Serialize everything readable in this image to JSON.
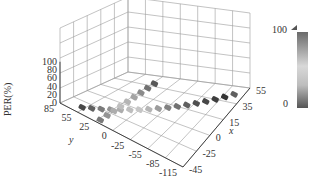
{
  "chart_data": {
    "type": "heatmap",
    "subtype": "3d-scatter-floor-projection",
    "title": "",
    "xlabel": "x",
    "ylabel": "y",
    "zlabel": "PER(%)",
    "x_ticks": [
      "55",
      "35",
      "15",
      "0",
      "-25",
      "-45"
    ],
    "y_ticks": [
      "85",
      "55",
      "25",
      "0",
      "-25",
      "-55",
      "-85",
      "-115"
    ],
    "z_ticks": [
      "0",
      "20",
      "40",
      "60",
      "80",
      "100"
    ],
    "xlim": [
      -45,
      55
    ],
    "ylim": [
      -115,
      85
    ],
    "zlim": [
      0,
      100
    ],
    "colorbar": {
      "min_label": "0",
      "max_label": "100",
      "range": [
        0,
        100
      ],
      "colormap": "gray-light-dark"
    },
    "grid": true,
    "series": [
      {
        "name": "track-1",
        "points": [
          {
            "x": 45,
            "y": 60,
            "per": 85
          },
          {
            "x": 40,
            "y": 50,
            "per": 70
          },
          {
            "x": 35,
            "y": 40,
            "per": 55
          },
          {
            "x": 30,
            "y": 30,
            "per": 40
          },
          {
            "x": 25,
            "y": 20,
            "per": 25
          },
          {
            "x": 20,
            "y": 10,
            "per": 15
          },
          {
            "x": 15,
            "y": 0,
            "per": 10
          },
          {
            "x": 10,
            "y": -10,
            "per": 20
          },
          {
            "x": 5,
            "y": -20,
            "per": 35
          },
          {
            "x": 0,
            "y": -30,
            "per": 50
          },
          {
            "x": -5,
            "y": -40,
            "per": 60
          },
          {
            "x": -10,
            "y": -50,
            "per": 70
          },
          {
            "x": -15,
            "y": -60,
            "per": 80
          },
          {
            "x": -20,
            "y": -70,
            "per": 85
          },
          {
            "x": -25,
            "y": -80,
            "per": 90
          },
          {
            "x": -30,
            "y": -90,
            "per": 95
          },
          {
            "x": -35,
            "y": -100,
            "per": 70
          }
        ]
      },
      {
        "name": "track-2",
        "points": [
          {
            "x": -30,
            "y": 25,
            "per": 75
          },
          {
            "x": -20,
            "y": 25,
            "per": 60
          },
          {
            "x": -10,
            "y": 25,
            "per": 45
          },
          {
            "x": 0,
            "y": 25,
            "per": 30
          },
          {
            "x": 10,
            "y": 25,
            "per": 20
          },
          {
            "x": 20,
            "y": 25,
            "per": 15
          },
          {
            "x": 30,
            "y": 25,
            "per": 25
          },
          {
            "x": 40,
            "y": 25,
            "per": 40
          },
          {
            "x": 50,
            "y": 25,
            "per": 55
          }
        ]
      }
    ]
  },
  "labels": {
    "zlabel": "PER(%)",
    "xlabel": "x",
    "ylabel": "y",
    "cb_max": "100",
    "cb_min": "0"
  }
}
